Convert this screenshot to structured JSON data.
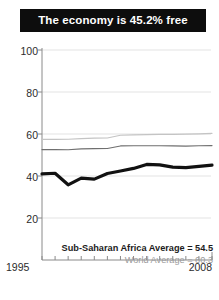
{
  "title": {
    "text": "The economy is 45.2% free",
    "background": "#0d0d0d",
    "color": "#ffffff"
  },
  "legend": {
    "primary": "Sub-Saharan Africa Average = 54.5",
    "secondary": "World Average = 60.3"
  },
  "axis": {
    "y_ticks": [
      "100",
      "80",
      "60",
      "40",
      "20"
    ],
    "x_start": "1995",
    "x_end": "2008"
  },
  "chart_data": {
    "type": "line",
    "title": "The economy is 45.2% free",
    "xlabel": "",
    "ylabel": "",
    "xlim": [
      1995,
      2008
    ],
    "ylim": [
      20,
      100
    ],
    "yticks": [
      20,
      40,
      60,
      80,
      100
    ],
    "grid": true,
    "legend_position": "inside-bottom-right",
    "x": [
      1995,
      1996,
      1997,
      1998,
      1999,
      2000,
      2001,
      2002,
      2003,
      2004,
      2005,
      2006,
      2007,
      2008
    ],
    "series": [
      {
        "name": "Country economic freedom score",
        "color": "#111111",
        "width": 3.2,
        "values": [
          41.0,
          41.3,
          35.8,
          39.0,
          38.5,
          41.2,
          42.4,
          43.6,
          45.5,
          45.3,
          44.2,
          44.0,
          44.6,
          45.2
        ]
      },
      {
        "name": "Sub-Saharan Africa Average = 54.5",
        "color": "#6f6f6f",
        "width": 1.2,
        "values": [
          52.6,
          52.6,
          52.5,
          52.9,
          53.0,
          53.1,
          54.3,
          54.4,
          54.4,
          54.4,
          54.3,
          54.2,
          54.4,
          54.5
        ]
      },
      {
        "name": "World Average = 60.3",
        "color": "#c4c4c4",
        "width": 1.2,
        "values": [
          57.4,
          57.4,
          57.5,
          57.8,
          58.0,
          58.1,
          59.4,
          59.6,
          59.7,
          59.8,
          59.8,
          59.9,
          60.1,
          60.3
        ]
      }
    ],
    "annotations": [
      {
        "text": "Sub-Saharan Africa Average = 54.5",
        "style": "bold-dark"
      },
      {
        "text": "World Average = 60.3",
        "style": "gray"
      }
    ]
  }
}
